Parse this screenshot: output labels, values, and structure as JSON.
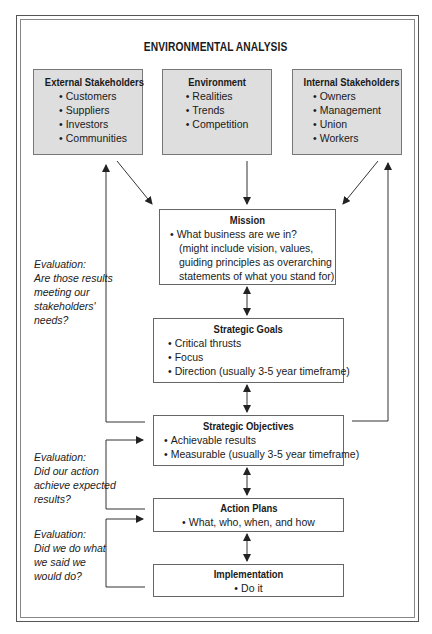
{
  "header": {
    "cut_title_fragment": "Strategic Planning"
  },
  "diagram": {
    "title": "ENVIRONMENTAL ANALYSIS",
    "top_boxes": [
      {
        "title": "External Stakeholders",
        "items": [
          "Customers",
          "Suppliers",
          "Investors",
          "Communities"
        ]
      },
      {
        "title": "Environment",
        "items": [
          "Realities",
          "Trends",
          "Competition"
        ]
      },
      {
        "title": "Internal Stakeholders",
        "items": [
          "Owners",
          "Management",
          "Union",
          "Workers"
        ]
      }
    ],
    "mission": {
      "title": "Mission",
      "lines": [
        "What business are we in?",
        "(might include vision, values,",
        "guiding principles as overarching",
        "statements of what you stand for)"
      ]
    },
    "goals": {
      "title": "Strategic Goals",
      "items": [
        "Critical thrusts",
        "Focus",
        "Direction (usually 3-5 year timeframe)"
      ]
    },
    "objectives": {
      "title": "Strategic Objectives",
      "items": [
        "Achievable results",
        "Measurable (usually 3-5 year timeframe)"
      ]
    },
    "action_plans": {
      "title": "Action Plans",
      "items": [
        "What, who, when, and how"
      ]
    },
    "implementation": {
      "title": "Implementation",
      "items": [
        "Do it"
      ]
    },
    "evaluations": [
      {
        "lines": [
          "Evaluation:",
          "Are those results",
          "meeting our",
          "stakeholders'",
          "needs?"
        ]
      },
      {
        "lines": [
          "Evaluation:",
          "Did our action",
          "achieve expected",
          "results?"
        ]
      },
      {
        "lines": [
          "Evaluation:",
          "Did we do what",
          "we said we",
          "would do?"
        ]
      }
    ],
    "colors": {
      "box_fill": "#dedede",
      "line": "#333333",
      "frame": "#555555"
    }
  }
}
